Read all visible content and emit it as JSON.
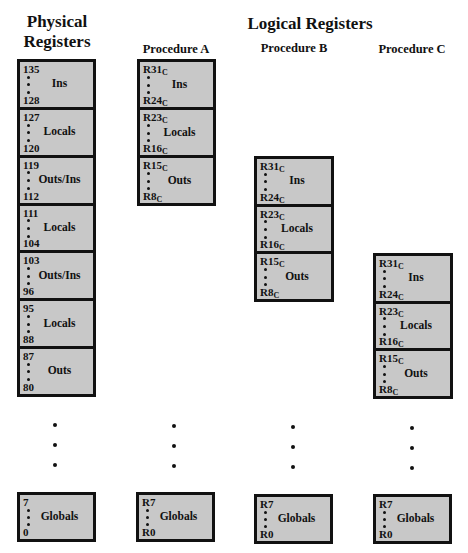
{
  "titles": {
    "physical": [
      "Physical",
      "Registers"
    ],
    "logical": "Logical Registers",
    "procedures": [
      "Procedure A",
      "Procedure B",
      "Procedure C"
    ]
  },
  "physical_registers": {
    "blocks": [
      {
        "hi": "135",
        "lo": "128",
        "label": "Ins"
      },
      {
        "hi": "127",
        "lo": "120",
        "label": "Locals"
      },
      {
        "hi": "119",
        "lo": "112",
        "label": "Outs/Ins"
      },
      {
        "hi": "111",
        "lo": "104",
        "label": "Locals"
      },
      {
        "hi": "103",
        "lo": "96",
        "label": "Outs/Ins"
      },
      {
        "hi": "95",
        "lo": "88",
        "label": "Locals"
      },
      {
        "hi": "87",
        "lo": "80",
        "label": "Outs"
      }
    ],
    "globals": {
      "hi": "7",
      "lo": "0",
      "label": "Globals"
    }
  },
  "procedures": [
    {
      "name": "Procedure A",
      "blocks": [
        {
          "hi": "R31",
          "hi_sub": "C",
          "lo": "R24",
          "lo_sub": "C",
          "label": "Ins"
        },
        {
          "hi": "R23",
          "hi_sub": "C",
          "lo": "R16",
          "lo_sub": "C",
          "label": "Locals"
        },
        {
          "hi": "R15",
          "hi_sub": "C",
          "lo": "R8",
          "lo_sub": "C",
          "label": "Outs"
        }
      ],
      "globals": {
        "hi": "R7",
        "lo": "R0",
        "label": "Globals"
      }
    },
    {
      "name": "Procedure B",
      "blocks": [
        {
          "hi": "R31",
          "hi_sub": "C",
          "lo": "R24",
          "lo_sub": "C",
          "label": "Ins"
        },
        {
          "hi": "R23",
          "hi_sub": "C",
          "lo": "R16",
          "lo_sub": "C",
          "label": "Locals"
        },
        {
          "hi": "R15",
          "hi_sub": "C",
          "lo": "R8",
          "lo_sub": "C",
          "label": "Outs"
        }
      ],
      "globals": {
        "hi": "R7",
        "lo": "R0",
        "label": "Globals"
      }
    },
    {
      "name": "Procedure C",
      "blocks": [
        {
          "hi": "R31",
          "hi_sub": "C",
          "lo": "R24",
          "lo_sub": "C",
          "label": "Ins"
        },
        {
          "hi": "R23",
          "hi_sub": "C",
          "lo": "R16",
          "lo_sub": "C",
          "label": "Locals"
        },
        {
          "hi": "R15",
          "hi_sub": "C",
          "lo": "R8",
          "lo_sub": "C",
          "label": "Outs"
        }
      ],
      "globals": {
        "hi": "R7",
        "lo": "R0",
        "label": "Globals"
      }
    }
  ],
  "colors": {
    "box_fill": "#c8c8c8",
    "border": "#111111",
    "background": "#ffffff"
  }
}
